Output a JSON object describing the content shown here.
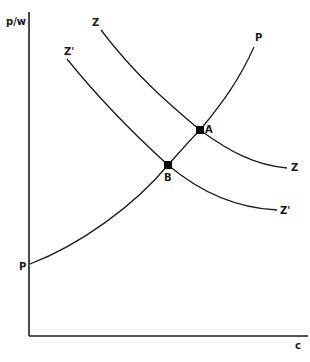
{
  "diagram": {
    "type": "economics-curve-diagram",
    "axes": {
      "y_label": "p/w",
      "x_label": "c"
    },
    "curves": [
      {
        "id": "Z",
        "label_start": "Z",
        "label_end": "Z",
        "shape": "downward-sloping convex"
      },
      {
        "id": "Z_prime",
        "label_start": "Z'",
        "label_end": "Z'",
        "shape": "downward-sloping convex"
      },
      {
        "id": "P",
        "label_start": "P",
        "label_end": "P",
        "shape": "upward-sloping convex"
      }
    ],
    "points": [
      {
        "label": "A",
        "description": "intersection of P and Z"
      },
      {
        "label": "B",
        "description": "intersection of P and Z'"
      }
    ],
    "colors": {
      "line": "#1e1e1e",
      "background": "#ffffff"
    }
  }
}
